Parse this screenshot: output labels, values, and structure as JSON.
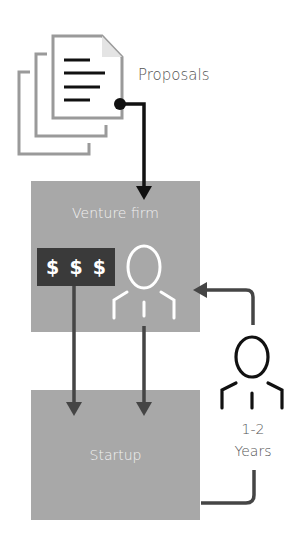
{
  "diagram": {
    "proposals": {
      "label": "Proposals",
      "icon": "document-stack-icon"
    },
    "venture_firm": {
      "label": "Venture firm",
      "money_symbols": [
        "$",
        "$",
        "$"
      ],
      "icon": "person-icon"
    },
    "startup": {
      "label": "Startup"
    },
    "founder": {
      "icon": "person-icon",
      "duration_line1": "1-2",
      "duration_line2": "Years"
    },
    "colors": {
      "box_fill": "#a8a8a8",
      "money_box": "#3a3a3a",
      "arrow_primary": "#111111",
      "arrow_secondary": "#454545",
      "document_stroke": "#9a9a9a",
      "text_gray": "#555555"
    },
    "flows": [
      {
        "from": "Proposals",
        "to": "Venture firm"
      },
      {
        "from": "Venture firm money",
        "to": "Startup"
      },
      {
        "from": "Venture firm person",
        "to": "Startup"
      },
      {
        "from": "Startup",
        "to": "Venture firm",
        "via": "1-2 Years person"
      }
    ]
  }
}
